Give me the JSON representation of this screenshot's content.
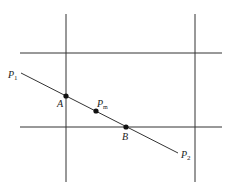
{
  "diagram": {
    "colors": {
      "line": "#333333",
      "point": "#111111",
      "background": "#ffffff"
    },
    "grid_lines": {
      "vertical": [
        {
          "x": 66,
          "y1": 14,
          "y2": 182
        },
        {
          "x": 195,
          "y1": 14,
          "y2": 182
        }
      ],
      "horizontal": [
        {
          "y": 53,
          "x1": 20,
          "x2": 222
        },
        {
          "y": 127,
          "x1": 20,
          "x2": 222
        }
      ]
    },
    "segment": {
      "from": "P1",
      "to": "P2",
      "x1": 21,
      "y1": 73,
      "x2": 178,
      "y2": 153
    },
    "points": [
      {
        "id": "A",
        "x": 66,
        "y": 96
      },
      {
        "id": "Pm",
        "x": 96,
        "y": 111
      },
      {
        "id": "B",
        "x": 126,
        "y": 127
      }
    ],
    "labels": {
      "P1": {
        "main": "P",
        "sub": "1"
      },
      "P2": {
        "main": "P",
        "sub": "2"
      },
      "A": {
        "main": "A"
      },
      "B": {
        "main": "B"
      },
      "Pm": {
        "main": "P",
        "sub": "m"
      }
    }
  }
}
